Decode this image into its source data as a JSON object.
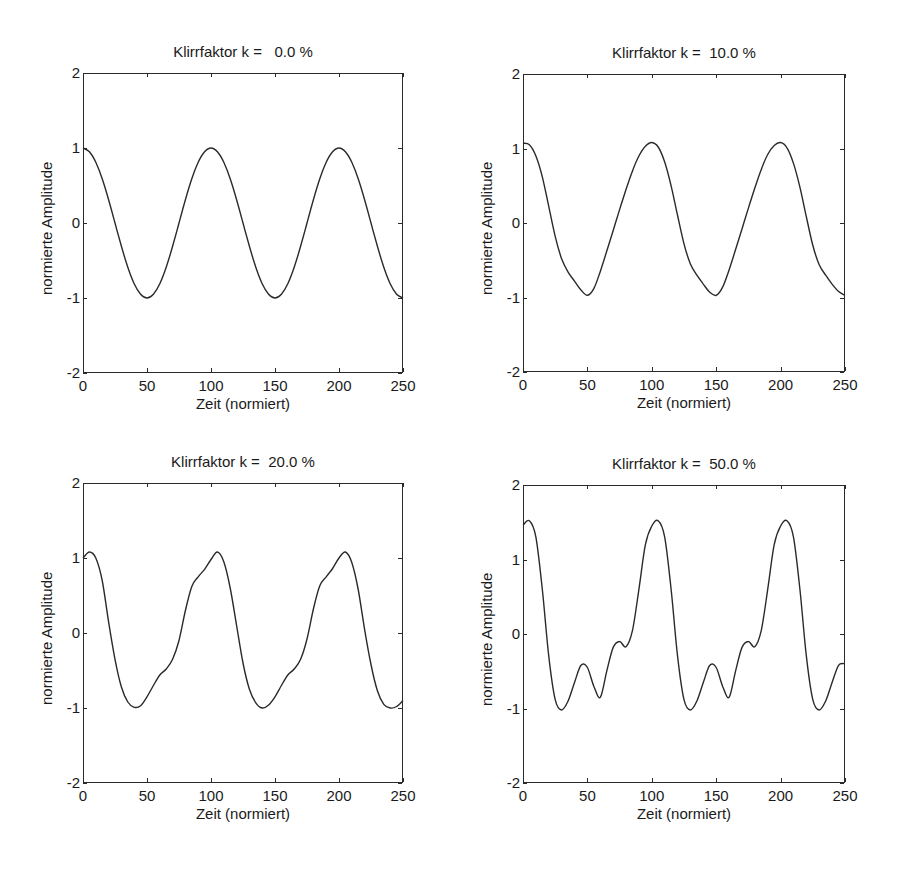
{
  "figure": {
    "panels": [
      {
        "title": "Klirrfaktor k =   0.0 %",
        "xlabel": "Zeit (normiert)",
        "ylabel": "normierte Amplitude"
      },
      {
        "title": "Klirrfaktor k =  10.0 %",
        "xlabel": "Zeit (normiert)",
        "ylabel": "normierte Amplitude"
      },
      {
        "title": "Klirrfaktor k =  20.0 %",
        "xlabel": "Zeit (normiert)",
        "ylabel": "normierte Amplitude"
      },
      {
        "title": "Klirrfaktor k =  50.0 %",
        "xlabel": "Zeit (normiert)",
        "ylabel": "normierte Amplitude"
      }
    ],
    "xticks": [
      "0",
      "50",
      "100",
      "150",
      "200",
      "250"
    ],
    "yticks": [
      "2",
      "1",
      "0",
      "-1",
      "-2"
    ]
  },
  "chart_data": [
    {
      "type": "line",
      "title": "Klirrfaktor k =   0.0 %",
      "xlabel": "Zeit (normiert)",
      "ylabel": "normierte Amplitude",
      "xlim": [
        0,
        250
      ],
      "ylim": [
        -2,
        2
      ],
      "grid": false,
      "x": [
        0,
        5,
        10,
        15,
        20,
        25,
        30,
        35,
        40,
        45,
        50,
        55,
        60,
        65,
        70,
        75,
        80,
        85,
        90,
        95,
        100,
        105,
        110,
        115,
        120,
        125,
        130,
        135,
        140,
        145,
        150,
        155,
        160,
        165,
        170,
        175,
        180,
        185,
        190,
        195,
        200,
        205,
        210,
        215,
        220,
        225,
        230,
        235,
        240,
        245,
        250
      ],
      "y": [
        1.0,
        0.95,
        0.81,
        0.59,
        0.31,
        0.0,
        -0.31,
        -0.59,
        -0.81,
        -0.95,
        -1.0,
        -0.95,
        -0.81,
        -0.59,
        -0.31,
        0.0,
        0.31,
        0.59,
        0.81,
        0.95,
        1.0,
        0.95,
        0.81,
        0.59,
        0.31,
        0.0,
        -0.31,
        -0.59,
        -0.81,
        -0.95,
        -1.0,
        -0.95,
        -0.81,
        -0.59,
        -0.31,
        0.0,
        0.31,
        0.59,
        0.81,
        0.95,
        1.0,
        0.95,
        0.81,
        0.59,
        0.31,
        0.0,
        -0.31,
        -0.59,
        -0.81,
        -0.95,
        -1.0
      ]
    },
    {
      "type": "line",
      "title": "Klirrfaktor k =  10.0 %",
      "xlabel": "Zeit (normiert)",
      "ylabel": "normierte Amplitude",
      "xlim": [
        0,
        250
      ],
      "ylim": [
        -2,
        2
      ],
      "grid": false,
      "x": [
        0,
        5,
        10,
        15,
        20,
        25,
        30,
        35,
        40,
        45,
        50,
        55,
        60,
        65,
        70,
        75,
        80,
        85,
        90,
        95,
        100,
        105,
        110,
        115,
        120,
        125,
        130,
        135,
        140,
        145,
        150,
        155,
        160,
        165,
        170,
        175,
        180,
        185,
        190,
        195,
        200,
        205,
        210,
        215,
        220,
        225,
        230,
        235,
        240,
        245,
        250
      ],
      "y": [
        1.07,
        1.05,
        0.9,
        0.62,
        0.22,
        -0.18,
        -0.48,
        -0.66,
        -0.78,
        -0.9,
        -0.97,
        -0.88,
        -0.65,
        -0.38,
        -0.1,
        0.18,
        0.45,
        0.7,
        0.9,
        1.03,
        1.08,
        1.02,
        0.82,
        0.5,
        0.1,
        -0.28,
        -0.55,
        -0.7,
        -0.82,
        -0.93,
        -0.97,
        -0.86,
        -0.63,
        -0.36,
        -0.08,
        0.2,
        0.47,
        0.72,
        0.92,
        1.04,
        1.08,
        1.01,
        0.8,
        0.48,
        0.08,
        -0.3,
        -0.56,
        -0.7,
        -0.82,
        -0.92,
        -0.97
      ]
    },
    {
      "type": "line",
      "title": "Klirrfaktor k =  20.0 %",
      "xlabel": "Zeit (normiert)",
      "ylabel": "normierte Amplitude",
      "xlim": [
        0,
        250
      ],
      "ylim": [
        -2,
        2
      ],
      "grid": false,
      "x": [
        0,
        5,
        10,
        15,
        20,
        25,
        30,
        35,
        40,
        45,
        50,
        55,
        60,
        65,
        70,
        75,
        80,
        85,
        90,
        95,
        100,
        105,
        110,
        115,
        120,
        125,
        130,
        135,
        140,
        145,
        150,
        155,
        160,
        165,
        170,
        175,
        180,
        185,
        190,
        195,
        200,
        205,
        210,
        215,
        220,
        225,
        230,
        235,
        240,
        245,
        250
      ],
      "y": [
        1.0,
        1.08,
        1.0,
        0.7,
        0.15,
        -0.35,
        -0.72,
        -0.92,
        -0.99,
        -0.97,
        -0.85,
        -0.7,
        -0.56,
        -0.48,
        -0.35,
        -0.1,
        0.3,
        0.62,
        0.75,
        0.85,
        0.98,
        1.08,
        0.95,
        0.6,
        0.1,
        -0.4,
        -0.75,
        -0.93,
        -1.0,
        -0.96,
        -0.85,
        -0.7,
        -0.56,
        -0.48,
        -0.35,
        -0.08,
        0.32,
        0.63,
        0.75,
        0.86,
        1.0,
        1.08,
        0.94,
        0.58,
        0.05,
        -0.42,
        -0.77,
        -0.95,
        -1.0,
        -0.98,
        -0.9
      ]
    },
    {
      "type": "line",
      "title": "Klirrfaktor k =  50.0 %",
      "xlabel": "Zeit (normiert)",
      "ylabel": "normierte Amplitude",
      "xlim": [
        0,
        250
      ],
      "ylim": [
        -2,
        2
      ],
      "grid": false,
      "x": [
        0,
        5,
        10,
        15,
        20,
        25,
        30,
        35,
        40,
        45,
        50,
        55,
        60,
        65,
        70,
        75,
        80,
        85,
        90,
        95,
        100,
        105,
        110,
        115,
        120,
        125,
        130,
        135,
        140,
        145,
        150,
        155,
        160,
        165,
        170,
        175,
        180,
        185,
        190,
        195,
        200,
        205,
        210,
        215,
        220,
        225,
        230,
        235,
        240,
        245,
        250
      ],
      "y": [
        1.46,
        1.52,
        1.3,
        0.6,
        -0.3,
        -0.88,
        -1.02,
        -0.9,
        -0.65,
        -0.42,
        -0.45,
        -0.7,
        -0.85,
        -0.5,
        -0.18,
        -0.1,
        -0.17,
        0.05,
        0.6,
        1.2,
        1.45,
        1.52,
        1.3,
        0.6,
        -0.3,
        -0.88,
        -1.02,
        -0.9,
        -0.65,
        -0.42,
        -0.45,
        -0.7,
        -0.85,
        -0.5,
        -0.18,
        -0.1,
        -0.17,
        0.05,
        0.6,
        1.2,
        1.45,
        1.52,
        1.3,
        0.6,
        -0.3,
        -0.88,
        -1.02,
        -0.9,
        -0.65,
        -0.42,
        -0.4
      ]
    }
  ]
}
